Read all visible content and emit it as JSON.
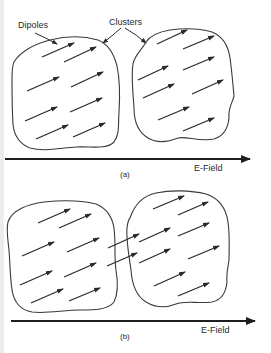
{
  "figure": {
    "panel_a": {
      "caption": "(a)",
      "field_label": "E-Field",
      "labels": {
        "dipoles": "Dipoles",
        "clusters": "Clusters"
      },
      "left_cluster_dipole_count": 8,
      "right_cluster_dipole_count": 8
    },
    "panel_b": {
      "caption": "(b)",
      "field_label": "E-Field",
      "left_cluster_dipole_count": 8,
      "right_cluster_dipole_count": 8,
      "bridging_dipole_count": 2
    },
    "colors": {
      "background": "#ffffff",
      "ink": "#2a2a2a"
    }
  }
}
